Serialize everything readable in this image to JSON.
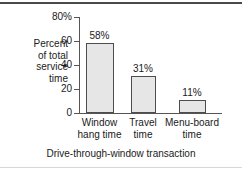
{
  "chart_data": {
    "type": "bar",
    "title": "",
    "subtitle": "",
    "categories": [
      "Window hang time",
      "Travel time",
      "Menu-board time"
    ],
    "category_lines": [
      [
        "Window",
        "hang time"
      ],
      [
        "Travel",
        "time"
      ],
      [
        "Menu-board",
        "time"
      ]
    ],
    "values": [
      58,
      31,
      11
    ],
    "data_labels": [
      "58%",
      "31%",
      "11%"
    ],
    "xlabel": "Drive-through-window transaction",
    "ylabel": "Percent of total service time",
    "ylabel_lines": [
      "Percent",
      "of total",
      "service",
      "time"
    ],
    "ylim": [
      0,
      80
    ],
    "yticks": [
      0,
      20,
      40,
      60,
      80
    ],
    "ytick_labels": [
      "0",
      "20",
      "40",
      "60",
      "80%"
    ],
    "grid": false,
    "legend": false,
    "legend_position": "none",
    "colors": {
      "bar_fill": "#e6e6e6",
      "bar_border": "#4d4d4d",
      "axis": "#555555",
      "text": "#1a1a1a",
      "background": "#ffffff",
      "rule_top": "#4a4a4a",
      "rule_bottom": "#d8d8d8"
    }
  }
}
